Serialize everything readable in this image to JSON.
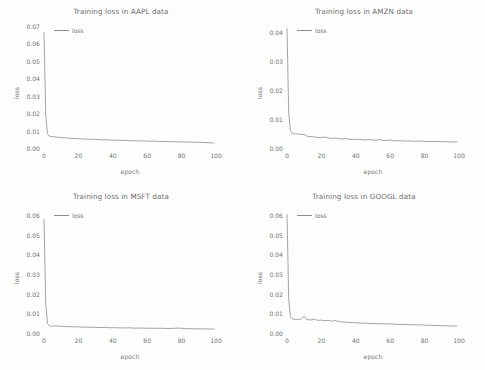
{
  "figure": {
    "background": "#fdfdfd",
    "line_color": "#8d8d8d",
    "text_color": "#757575"
  },
  "panels": [
    {
      "key": "aapl",
      "title": "Training loss in AAPL data",
      "legend_label": "loss",
      "xlabel": "epoch",
      "ylabel": "loss"
    },
    {
      "key": "amzn",
      "title": "Training loss in AMZN data",
      "legend_label": "loss",
      "xlabel": "epoch",
      "ylabel": "loss"
    },
    {
      "key": "msft",
      "title": "Training loss in MSFT data",
      "legend_label": "loss",
      "xlabel": "epoch",
      "ylabel": "loss"
    },
    {
      "key": "googl",
      "title": "Training loss in GOOGL data",
      "legend_label": "loss",
      "xlabel": "epoch",
      "ylabel": "loss"
    }
  ],
  "chart_data": [
    {
      "type": "line",
      "key": "aapl",
      "title": "Training loss in AAPL data",
      "xlabel": "epoch",
      "ylabel": "loss",
      "legend": [
        "loss"
      ],
      "legend_position": "upper-left",
      "grid": false,
      "xlim": [
        0,
        100
      ],
      "ylim": [
        0.0,
        0.07
      ],
      "xticks": [
        0,
        20,
        40,
        60,
        80,
        100
      ],
      "xticklabels": [
        "0",
        "20",
        "40",
        "60",
        "80",
        "100"
      ],
      "yticks": [
        0.0,
        0.01,
        0.02,
        0.03,
        0.04,
        0.05,
        0.06,
        0.07
      ],
      "yticklabels": [
        "0.00",
        "0.01",
        "0.02",
        "0.03",
        "0.04",
        "0.05",
        "0.06",
        "0.07"
      ],
      "series": [
        {
          "name": "loss",
          "x": [
            0,
            1,
            2,
            3,
            4,
            5,
            6,
            8,
            10,
            12,
            14,
            16,
            18,
            20,
            22,
            24,
            26,
            28,
            30,
            32,
            34,
            36,
            38,
            40,
            42,
            44,
            46,
            48,
            50,
            52,
            54,
            56,
            58,
            60,
            62,
            64,
            66,
            68,
            70,
            72,
            74,
            76,
            78,
            80,
            82,
            84,
            86,
            88,
            90,
            92,
            94,
            96,
            98,
            99
          ],
          "y": [
            0.0663,
            0.0192,
            0.0082,
            0.0069,
            0.0066,
            0.0065,
            0.0064,
            0.0062,
            0.006,
            0.0058,
            0.0057,
            0.0055,
            0.0054,
            0.0053,
            0.0052,
            0.0051,
            0.005,
            0.005,
            0.0049,
            0.0048,
            0.0047,
            0.0047,
            0.0046,
            0.0045,
            0.0045,
            0.0044,
            0.0044,
            0.0043,
            0.0042,
            0.0042,
            0.0041,
            0.0041,
            0.004,
            0.004,
            0.0039,
            0.0039,
            0.0038,
            0.0038,
            0.0037,
            0.0037,
            0.0036,
            0.0036,
            0.0035,
            0.0035,
            0.0034,
            0.0034,
            0.0033,
            0.0033,
            0.0032,
            0.0032,
            0.0031,
            0.003,
            0.0029,
            0.0029
          ]
        }
      ]
    },
    {
      "type": "line",
      "key": "amzn",
      "title": "Training loss in AMZN data",
      "xlabel": "epoch",
      "ylabel": "loss",
      "legend": [
        "loss"
      ],
      "legend_position": "upper-left",
      "grid": false,
      "xlim": [
        0,
        100
      ],
      "ylim": [
        0.0,
        0.042
      ],
      "xticks": [
        0,
        20,
        40,
        60,
        80,
        100
      ],
      "xticklabels": [
        "0",
        "20",
        "40",
        "60",
        "80",
        "100"
      ],
      "yticks": [
        0.0,
        0.01,
        0.02,
        0.03,
        0.04
      ],
      "yticklabels": [
        "0.00",
        "0.01",
        "0.02",
        "0.03",
        "0.04"
      ],
      "series": [
        {
          "name": "loss",
          "x": [
            0,
            1,
            2,
            3,
            4,
            5,
            6,
            8,
            10,
            12,
            14,
            16,
            18,
            20,
            22,
            24,
            26,
            28,
            30,
            32,
            34,
            36,
            38,
            40,
            42,
            44,
            46,
            48,
            50,
            52,
            54,
            56,
            58,
            60,
            62,
            64,
            66,
            68,
            70,
            72,
            74,
            76,
            78,
            80,
            82,
            84,
            86,
            88,
            90,
            92,
            94,
            96,
            98,
            99
          ],
          "y": [
            0.0412,
            0.0118,
            0.006,
            0.005,
            0.0049,
            0.0049,
            0.0048,
            0.0047,
            0.0046,
            0.004,
            0.0039,
            0.0038,
            0.0036,
            0.0036,
            0.0038,
            0.0034,
            0.0033,
            0.0035,
            0.0032,
            0.0031,
            0.0033,
            0.003,
            0.003,
            0.0029,
            0.003,
            0.0028,
            0.0028,
            0.0029,
            0.0027,
            0.0027,
            0.0029,
            0.0026,
            0.0026,
            0.0028,
            0.0025,
            0.0025,
            0.0025,
            0.0024,
            0.0024,
            0.0024,
            0.0023,
            0.0023,
            0.0024,
            0.0023,
            0.0022,
            0.0022,
            0.0023,
            0.0022,
            0.0022,
            0.0022,
            0.0021,
            0.0021,
            0.0021,
            0.0021
          ]
        }
      ]
    },
    {
      "type": "line",
      "key": "msft",
      "title": "Training loss in MSFT data",
      "xlabel": "epoch",
      "ylabel": "loss",
      "legend": [
        "loss"
      ],
      "legend_position": "upper-left",
      "grid": false,
      "xlim": [
        0,
        100
      ],
      "ylim": [
        0.0,
        0.062
      ],
      "xticks": [
        0,
        20,
        40,
        60,
        80,
        100
      ],
      "xticklabels": [
        "0",
        "20",
        "40",
        "60",
        "80",
        "100"
      ],
      "yticks": [
        0.0,
        0.01,
        0.02,
        0.03,
        0.04,
        0.05,
        0.06
      ],
      "yticklabels": [
        "0.00",
        "0.01",
        "0.02",
        "0.03",
        "0.04",
        "0.05",
        "0.06"
      ],
      "series": [
        {
          "name": "loss",
          "x": [
            0,
            1,
            2,
            3,
            4,
            5,
            6,
            8,
            10,
            12,
            14,
            16,
            18,
            20,
            22,
            24,
            26,
            28,
            30,
            32,
            34,
            36,
            38,
            40,
            42,
            44,
            46,
            48,
            50,
            52,
            54,
            56,
            58,
            60,
            62,
            64,
            66,
            68,
            70,
            72,
            74,
            76,
            78,
            80,
            82,
            84,
            86,
            88,
            90,
            92,
            94,
            96,
            98,
            99
          ],
          "y": [
            0.0578,
            0.0152,
            0.0048,
            0.0036,
            0.0034,
            0.0035,
            0.0036,
            0.0035,
            0.0034,
            0.0033,
            0.0032,
            0.0032,
            0.0031,
            0.0031,
            0.003,
            0.003,
            0.0029,
            0.0029,
            0.0029,
            0.0028,
            0.0028,
            0.0028,
            0.0027,
            0.0027,
            0.0027,
            0.0026,
            0.0026,
            0.0026,
            0.0026,
            0.0025,
            0.0025,
            0.0025,
            0.0025,
            0.0024,
            0.0024,
            0.0024,
            0.0024,
            0.0024,
            0.0023,
            0.0023,
            0.0023,
            0.0024,
            0.0025,
            0.0024,
            0.0022,
            0.0022,
            0.0022,
            0.0021,
            0.0021,
            0.0021,
            0.0021,
            0.002,
            0.002,
            0.002
          ]
        }
      ]
    },
    {
      "type": "line",
      "key": "googl",
      "title": "Training loss in GOOGL data",
      "xlabel": "epoch",
      "ylabel": "loss",
      "legend": [
        "loss"
      ],
      "legend_position": "upper-left",
      "grid": false,
      "xlim": [
        0,
        100
      ],
      "ylim": [
        0.0,
        0.062
      ],
      "xticks": [
        0,
        20,
        40,
        60,
        80,
        100
      ],
      "xticklabels": [
        "0",
        "20",
        "40",
        "60",
        "80",
        "100"
      ],
      "yticks": [
        0.0,
        0.01,
        0.02,
        0.03,
        0.04,
        0.05,
        0.06
      ],
      "yticklabels": [
        "0.00",
        "0.01",
        "0.02",
        "0.03",
        "0.04",
        "0.05",
        "0.06"
      ],
      "series": [
        {
          "name": "loss",
          "x": [
            0,
            1,
            2,
            3,
            4,
            5,
            6,
            7,
            8,
            9,
            10,
            11,
            12,
            14,
            16,
            18,
            20,
            22,
            24,
            26,
            28,
            30,
            32,
            34,
            36,
            38,
            40,
            42,
            44,
            46,
            48,
            50,
            52,
            54,
            56,
            58,
            60,
            62,
            64,
            66,
            68,
            70,
            72,
            74,
            76,
            78,
            80,
            82,
            84,
            86,
            88,
            90,
            92,
            94,
            96,
            98,
            99
          ],
          "y": [
            0.0605,
            0.017,
            0.0082,
            0.0072,
            0.007,
            0.0069,
            0.0068,
            0.0071,
            0.0069,
            0.0078,
            0.0085,
            0.0072,
            0.0068,
            0.0066,
            0.007,
            0.0064,
            0.0066,
            0.0062,
            0.0064,
            0.006,
            0.0064,
            0.0058,
            0.0056,
            0.0055,
            0.0054,
            0.0053,
            0.0052,
            0.0051,
            0.005,
            0.005,
            0.0049,
            0.0048,
            0.0048,
            0.0047,
            0.0047,
            0.0046,
            0.0046,
            0.0045,
            0.0044,
            0.0044,
            0.0043,
            0.0043,
            0.0042,
            0.0042,
            0.0041,
            0.0042,
            0.004,
            0.0039,
            0.0039,
            0.0038,
            0.0038,
            0.0037,
            0.0037,
            0.0036,
            0.0036,
            0.0035,
            0.0035
          ]
        }
      ]
    }
  ]
}
